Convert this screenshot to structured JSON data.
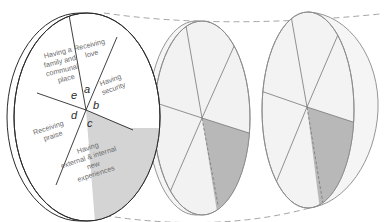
{
  "diagram": {
    "colors": {
      "outline_dark": "#2b2b2b",
      "outline_light": "#8a8a8a",
      "disc_fill_light": "#f2f2f2",
      "highlight": "#b8b8b8",
      "dashed": "#9a9a9a"
    },
    "discs": [
      {
        "id": "disc-1",
        "segments": [
          {
            "letter": "a",
            "lines": [
              "Receiving",
              "love"
            ]
          },
          {
            "letter": "b",
            "lines": [
              "Having",
              "security"
            ]
          },
          {
            "letter": "c",
            "lines": [
              "Having",
              "external & internal",
              "new",
              "experiences"
            ],
            "highlighted": true
          },
          {
            "letter": "d",
            "lines": [
              "Receiving",
              "praise"
            ]
          },
          {
            "letter": "e",
            "lines": [
              "Having a",
              "family and",
              "communal",
              "place"
            ]
          }
        ]
      },
      {
        "id": "disc-2",
        "highlighted_segment": "c"
      },
      {
        "id": "disc-3",
        "highlighted_segment": "c"
      }
    ]
  }
}
